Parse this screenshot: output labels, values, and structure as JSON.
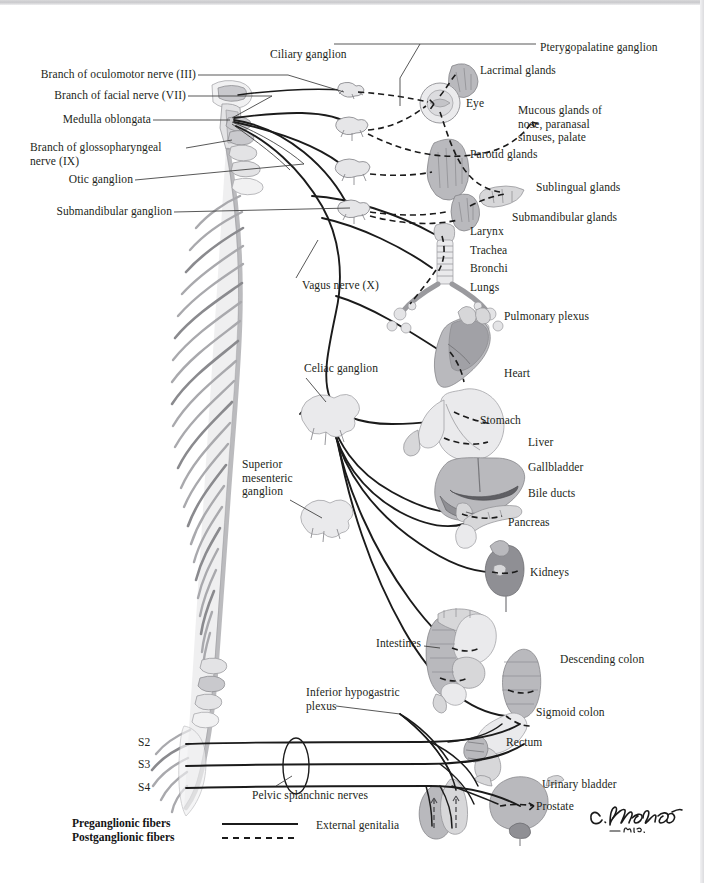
{
  "figure": {
    "signature": "C.Machado",
    "signature_suffix": "_M.D."
  },
  "left_labels": [
    {
      "id": "oculomotor",
      "text": "Branch of oculomotor nerve (III)"
    },
    {
      "id": "facial",
      "text": "Branch of facial nerve (VII)"
    },
    {
      "id": "medulla",
      "text": "Medulla oblongata"
    },
    {
      "id": "glossopharyngeal",
      "text": "Branch of glossopharyngeal\nnerve (IX)"
    },
    {
      "id": "otic",
      "text": "Otic ganglion"
    },
    {
      "id": "submandibular",
      "text": "Submandibular ganglion"
    },
    {
      "id": "vagus",
      "text": "Vagus nerve (X)"
    },
    {
      "id": "celiac",
      "text": "Celiac ganglion"
    },
    {
      "id": "superior-mesenteric",
      "text": "Superior\nmesenteric\nganglion"
    },
    {
      "id": "intestines",
      "text": "Intestines"
    },
    {
      "id": "inferior-hypogastric",
      "text": "Inferior hypogastric\nplexus"
    },
    {
      "id": "pelvic-splanchnic",
      "text": "Pelvic splanchnic nerves"
    },
    {
      "id": "external-genitalia",
      "text": "External genitalia"
    }
  ],
  "top_labels": [
    {
      "id": "ciliary",
      "text": "Ciliary ganglion"
    },
    {
      "id": "pterygopalatine",
      "text": "Pterygopalatine ganglion"
    }
  ],
  "right_labels": [
    {
      "id": "lacrimal",
      "text": "Lacrimal glands"
    },
    {
      "id": "eye",
      "text": "Eye"
    },
    {
      "id": "mucous",
      "text": "Mucous glands of\nnose, paranasal\nsinuses, palate"
    },
    {
      "id": "parotid",
      "text": "Parotid glands"
    },
    {
      "id": "sublingual",
      "text": "Sublingual glands"
    },
    {
      "id": "submandibular-glands",
      "text": "Submandibular glands"
    },
    {
      "id": "larynx",
      "text": "Larynx"
    },
    {
      "id": "trachea",
      "text": "Trachea"
    },
    {
      "id": "bronchi",
      "text": "Bronchi"
    },
    {
      "id": "lungs",
      "text": "Lungs"
    },
    {
      "id": "pulmonary-plexus",
      "text": "Pulmonary plexus"
    },
    {
      "id": "heart",
      "text": "Heart"
    },
    {
      "id": "stomach",
      "text": "Stomach"
    },
    {
      "id": "liver",
      "text": "Liver"
    },
    {
      "id": "gallbladder",
      "text": "Gallbladder"
    },
    {
      "id": "bile-ducts",
      "text": "Bile ducts"
    },
    {
      "id": "pancreas",
      "text": "Pancreas"
    },
    {
      "id": "kidneys",
      "text": "Kidneys"
    },
    {
      "id": "descending-colon",
      "text": "Descending colon"
    },
    {
      "id": "sigmoid-colon",
      "text": "Sigmoid colon"
    },
    {
      "id": "rectum",
      "text": "Rectum"
    },
    {
      "id": "urinary-bladder",
      "text": "Urinary bladder"
    },
    {
      "id": "prostate",
      "text": "Prostate"
    }
  ],
  "spinal_levels": [
    {
      "id": "s2",
      "text": "S2"
    },
    {
      "id": "s3",
      "text": "S3"
    },
    {
      "id": "s4",
      "text": "S4"
    }
  ],
  "legend": {
    "preganglionic": "Preganglionic fibers",
    "postganglionic": "Postganglionic fibers",
    "preganglionic_style": "solid",
    "postganglionic_style": "dashed"
  },
  "colors": {
    "background": "#ffffff",
    "line": "#1b1b1b",
    "leader": "#3a3a3a",
    "text": "#231f20",
    "organ_light": "#d7d7d9",
    "organ_mid": "#b9b9bd",
    "organ_dark": "#8f8f94",
    "bone": "#c9c9cd"
  }
}
